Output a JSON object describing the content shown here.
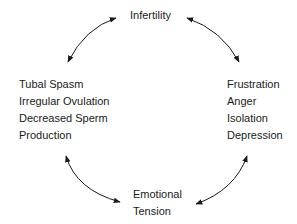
{
  "diagram": {
    "top": {
      "lines": [
        "Infertility"
      ]
    },
    "left": {
      "lines": [
        "Tubal Spasm",
        "Irregular Ovulation",
        "Decreased Sperm",
        "Production"
      ]
    },
    "right": {
      "lines": [
        "Frustration",
        "Anger",
        "Isolation",
        "Depression"
      ]
    },
    "bottom": {
      "lines": [
        "Emotional",
        "Tension"
      ]
    },
    "arrows": [
      {
        "from": "top",
        "to": "left",
        "type": "double-headed-curved"
      },
      {
        "from": "top",
        "to": "right",
        "type": "double-headed-curved"
      },
      {
        "from": "left",
        "to": "bottom",
        "type": "double-headed-curved"
      },
      {
        "from": "right",
        "to": "bottom",
        "type": "double-headed-curved"
      }
    ],
    "colors": {
      "ink": "#1a1a1a",
      "background": "#ffffff"
    }
  }
}
